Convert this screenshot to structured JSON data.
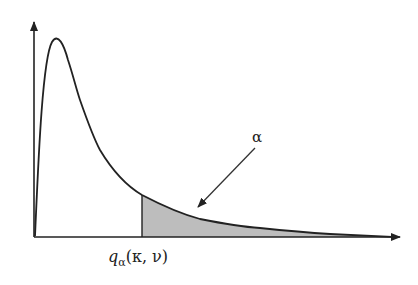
{
  "diagram": {
    "type": "density-curve-upper-tail",
    "labels": {
      "tail_area": "α",
      "quantile_q": "q",
      "quantile_sub": "α",
      "quantile_args": "(κ, ν)"
    },
    "colors": {
      "line": "#222222",
      "shade": "#bdbdbd",
      "background": "#ffffff"
    }
  }
}
